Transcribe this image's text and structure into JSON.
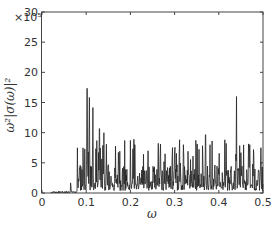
{
  "chart_data": {
    "type": "line",
    "title": "",
    "xlabel": "ω",
    "ylabel": "ω²|σ(ω)|²",
    "y_multiplier": "×10⁵",
    "xlim": [
      0,
      0.5
    ],
    "ylim": [
      0,
      30
    ],
    "xticks": [
      "0",
      "0.1",
      "0.2",
      "0.3",
      "0.4",
      "0.5"
    ],
    "yticks": [
      "0",
      "5",
      "10",
      "15",
      "20",
      "25",
      "30"
    ],
    "grid": false,
    "legend": null,
    "peaks": [
      {
        "x": 0.065,
        "y": 2
      },
      {
        "x": 0.085,
        "y": 5
      },
      {
        "x": 0.093,
        "y": 9
      },
      {
        "x": 0.102,
        "y": 26
      },
      {
        "x": 0.107,
        "y": 19
      },
      {
        "x": 0.115,
        "y": 17
      },
      {
        "x": 0.122,
        "y": 11
      },
      {
        "x": 0.13,
        "y": 16
      },
      {
        "x": 0.14,
        "y": 10
      },
      {
        "x": 0.15,
        "y": 7
      },
      {
        "x": 0.165,
        "y": 5
      },
      {
        "x": 0.21,
        "y": 12
      },
      {
        "x": 0.24,
        "y": 7
      },
      {
        "x": 0.3,
        "y": 7
      },
      {
        "x": 0.32,
        "y": 8
      },
      {
        "x": 0.37,
        "y": 14.5
      },
      {
        "x": 0.38,
        "y": 8
      },
      {
        "x": 0.44,
        "y": 16
      },
      {
        "x": 0.45,
        "y": 10
      },
      {
        "x": 0.47,
        "y": 12
      },
      {
        "x": 0.495,
        "y": 9
      }
    ]
  }
}
